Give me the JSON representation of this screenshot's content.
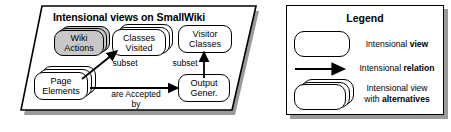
{
  "diagram": {
    "views_panel": {
      "title": "Intensional views on SmallWiki",
      "nodes": [
        {
          "id": "wiki-actions",
          "label": "Wiki\nActions",
          "style": "alternatives",
          "shaded": true
        },
        {
          "id": "classes-visited",
          "label": "Classes\nVisited",
          "style": "alternatives",
          "shaded": false
        },
        {
          "id": "visitor-classes",
          "label": "Visitor\nClasses",
          "style": "single",
          "shaded": false
        },
        {
          "id": "page-elements",
          "label": "Page\nElements",
          "style": "alternatives",
          "shaded": false
        },
        {
          "id": "output-gener",
          "label": "Output\nGener.",
          "style": "single",
          "shaded": false
        }
      ],
      "edges": [
        {
          "id": "page-elements-to-classes-visited",
          "label": "subset",
          "from": "page-elements",
          "to": "classes-visited"
        },
        {
          "id": "page-elements-to-output-gener",
          "label": "are Accepted\nby",
          "from": "page-elements",
          "to": "output-gener"
        },
        {
          "id": "output-gener-to-visitor-classes",
          "label": "subset",
          "from": "output-gener",
          "to": "visitor-classes"
        }
      ]
    },
    "legend_panel": {
      "title": "Legend",
      "items": [
        {
          "id": "intensional-view",
          "symbol": "rounded-box",
          "text_plain": "Intensional view",
          "text_normal": "Intensional ",
          "text_bold": "view",
          "text_line2_normal": "",
          "text_line2_bold": ""
        },
        {
          "id": "intensional-relation",
          "symbol": "arrow",
          "text_plain": "Intensional relation",
          "text_normal": "Intensional ",
          "text_bold": "relation",
          "text_line2_normal": "",
          "text_line2_bold": ""
        },
        {
          "id": "intensional-view-alternatives",
          "symbol": "stacked-rounded-box",
          "text_plain": "Intensional view with alternatives",
          "text_normal": "Intensional view",
          "text_bold": "",
          "text_line2_normal": "with ",
          "text_line2_bold": "alternatives"
        }
      ]
    },
    "colors": {
      "stroke": "#000000",
      "shaded_fill": "#c8c8c8",
      "panel_fill": "#ffffff",
      "shadow": "#9a9a9a"
    }
  }
}
